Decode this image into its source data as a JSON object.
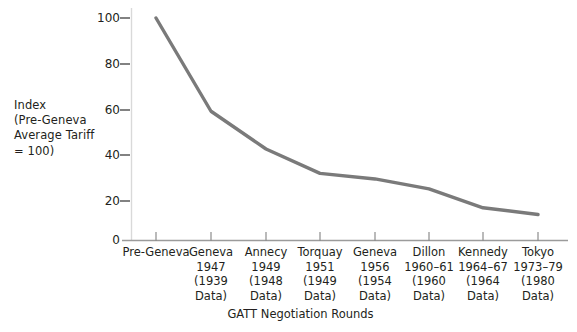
{
  "chart_data": {
    "type": "line",
    "title": "",
    "xlabel": "GATT Negotiation Rounds",
    "ylabel": "Index (Pre-Geneva Average Tariff = 100)",
    "ylabel_lines": [
      "Index",
      "(Pre-Geneva",
      "Average Tariff",
      "= 100)"
    ],
    "ylim": [
      0,
      100
    ],
    "yticks": [
      0,
      20,
      40,
      60,
      80,
      100
    ],
    "ytick_labels": [
      "0",
      "20",
      "40",
      "60",
      "80",
      "100"
    ],
    "grid": false,
    "legend": null,
    "line_color": "#7a7a7a",
    "categories": [
      "Pre-Geneva",
      "Geneva 1947 (1939 Data)",
      "Annecy 1949 (1948 Data)",
      "Torquay 1951 (1949 Data)",
      "Geneva 1956 (1954 Data)",
      "Dillon 1960-61 (1960 Data)",
      "Kennedy 1964-67 (1964 Data)",
      "Tokyo 1973-79 (1980 Data)"
    ],
    "values": [
      100,
      58,
      41,
      30,
      27.5,
      23,
      14.5,
      11.5
    ],
    "xtick_labels": [
      {
        "name": "Pre-Geneva",
        "years": "",
        "data": "",
        "data2": ""
      },
      {
        "name": "Geneva",
        "years": "1947",
        "data": "(1939",
        "data2": "Data)"
      },
      {
        "name": "Annecy",
        "years": "1949",
        "data": "(1948",
        "data2": "Data)"
      },
      {
        "name": "Torquay",
        "years": "1951",
        "data": "(1949",
        "data2": "Data)"
      },
      {
        "name": "Geneva",
        "years": "1956",
        "data": "(1954",
        "data2": "Data)"
      },
      {
        "name": "Dillon",
        "years": "1960–61",
        "data": "(1960",
        "data2": "Data)"
      },
      {
        "name": "Kennedy",
        "years": "1964–67",
        "data": "(1964",
        "data2": "Data)"
      },
      {
        "name": "Tokyo",
        "years": "1973–79",
        "data": "(1980",
        "data2": "Data)"
      }
    ]
  }
}
